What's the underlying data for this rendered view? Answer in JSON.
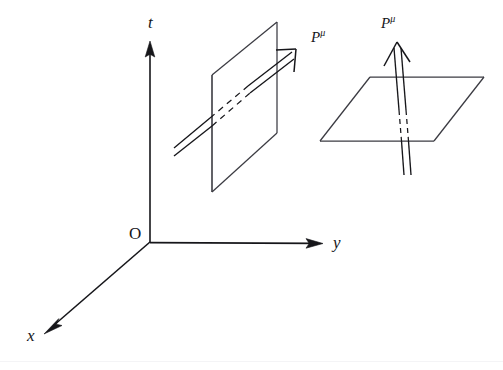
{
  "figure": {
    "background_color": "#ffffff",
    "stroke_color": "#16161a",
    "canvas": {
      "width": 503,
      "height": 370
    }
  },
  "axes": {
    "origin": {
      "name": "origin",
      "label": "O",
      "x": 150,
      "y": 242
    },
    "items": [
      {
        "name": "t-axis",
        "label": "t",
        "direction": "up",
        "from": [
          150,
          242
        ],
        "to": [
          150,
          42
        ],
        "arrowhead": true,
        "label_x": 152,
        "label_y": 22
      },
      {
        "name": "y-axis",
        "label": "y",
        "direction": "right",
        "from": [
          150,
          242
        ],
        "to": [
          322,
          243
        ],
        "arrowhead": true,
        "label_x": 337,
        "label_y": 243
      },
      {
        "name": "x-axis",
        "label": "x",
        "direction": "down-left",
        "from": [
          150,
          242
        ],
        "to": [
          44,
          334
        ],
        "arrowhead": true,
        "label_x": 32,
        "label_y": 336
      }
    ]
  },
  "panels": [
    {
      "name": "spacelike-plane-panel",
      "plane": {
        "name": "vertical-plane",
        "orientation": "vertical",
        "shape": "parallelogram",
        "corners": [
          [
            212,
            75
          ],
          [
            277,
            22
          ],
          [
            277,
            133
          ],
          [
            212,
            192
          ]
        ]
      },
      "vector": {
        "name": "four-momentum-vector-oblique",
        "label": "P",
        "superscript": "μ",
        "style": "double-line",
        "tail": [
          174,
          153
        ],
        "tip": [
          296,
          50
        ],
        "hidden_segment": [
          [
            212,
            141
          ],
          [
            249,
            109
          ]
        ],
        "arrowhead": "open-barb",
        "label_x": 313,
        "label_y": 32
      }
    },
    {
      "name": "timelike-plane-panel",
      "plane": {
        "name": "horizontal-plane",
        "orientation": "horizontal",
        "shape": "parallelogram",
        "corners": [
          [
            370,
            77
          ],
          [
            484,
            77
          ],
          [
            434,
            141
          ],
          [
            320,
            141
          ]
        ]
      },
      "vector": {
        "name": "four-momentum-vector-vertical",
        "label": "P",
        "superscript": "μ",
        "style": "double-line",
        "tail": [
          405,
          176
        ],
        "tip": [
          397,
          42
        ],
        "hidden_segment": [
          [
            400,
            110
          ],
          [
            403,
            141
          ]
        ],
        "arrowhead": "open-barb",
        "label_x": 383,
        "label_y": 18
      }
    }
  ]
}
